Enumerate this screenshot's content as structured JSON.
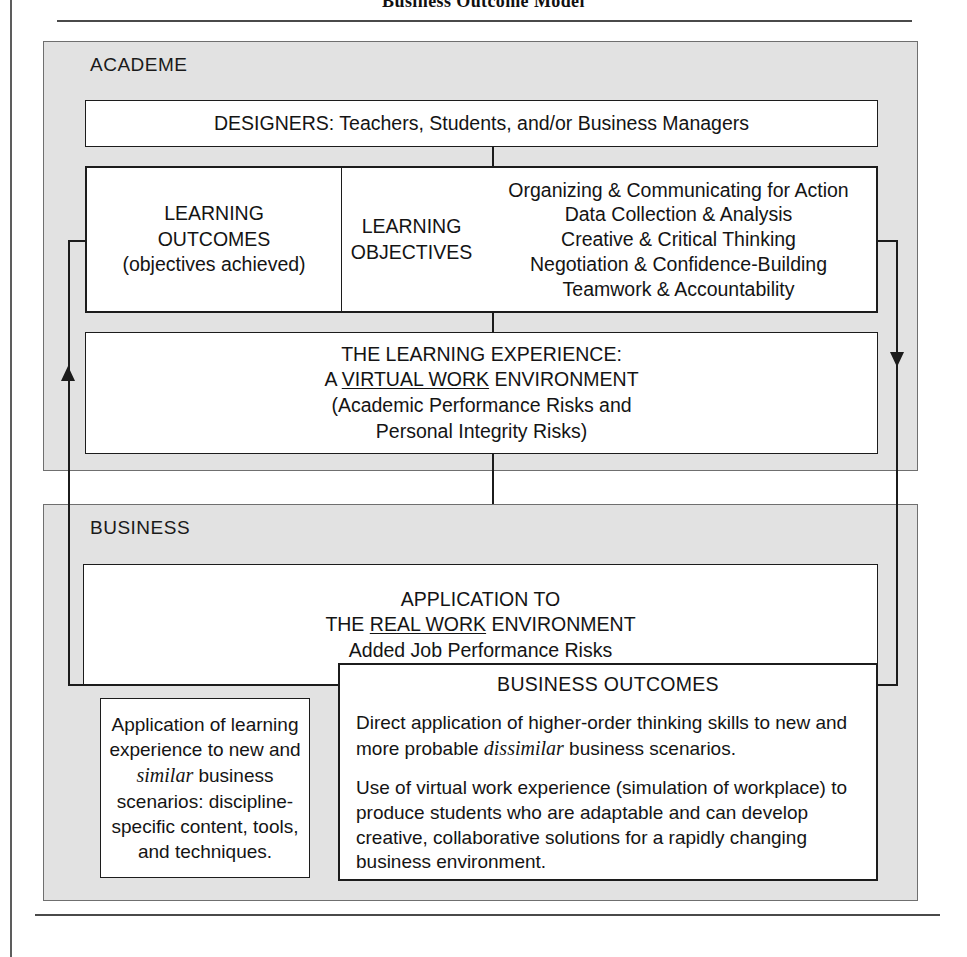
{
  "figure": {
    "title": "Business Outcome Model"
  },
  "academe": {
    "label": "ACADEME",
    "designers": "DESIGNERS: Teachers, Students, and/or Business Managers",
    "learning_outcomes": {
      "line1": "LEARNING",
      "line2": "OUTCOMES",
      "line3": "(objectives achieved)"
    },
    "learning_objectives": {
      "line1": "LEARNING",
      "line2": "OBJECTIVES"
    },
    "skills": [
      "Organizing & Communicating for Action",
      "Data Collection & Analysis",
      "Creative & Critical Thinking",
      "Negotiation & Confidence-Building",
      "Teamwork & Accountability"
    ],
    "experience": {
      "line1": "THE LEARNING EXPERIENCE:",
      "line2_pre": "A ",
      "line2_underline": "VIRTUAL WORK",
      "line2_post": " ENVIRONMENT",
      "line3": "(Academic Performance Risks and",
      "line4": "Personal Integrity Risks)"
    }
  },
  "business": {
    "label": "BUSINESS",
    "application": {
      "line1": "APPLICATION TO",
      "line2_pre": "THE ",
      "line2_underline": "REAL WORK",
      "line2_post": " ENVIRONMENT",
      "line3": "Added Job Performance Risks"
    },
    "left_application": {
      "pre": "Application of learning experience to new and ",
      "italic": "similar",
      "post": " business scenarios: discipline-specific content, tools, and techniques."
    },
    "outcomes": {
      "heading": "BUSINESS OUTCOMES",
      "para1_pre": "Direct application of higher-order thinking skills to new and more probable ",
      "para1_italic": "dissimilar",
      "para1_post": " business scenarios.",
      "para2": "Use of virtual work experience (simulation of workplace) to produce students who are adaptable and can develop creative, collaborative solutions for a rapidly changing business environment."
    }
  },
  "connectors": {
    "left_loop_arrow": "arrow-up",
    "right_loop_arrow": "arrow-down"
  },
  "colors": {
    "panel_fill": "#e2e2e2",
    "box_fill": "#ffffff",
    "stroke": "#1c1c1c",
    "rule": "#4a4a4a"
  }
}
